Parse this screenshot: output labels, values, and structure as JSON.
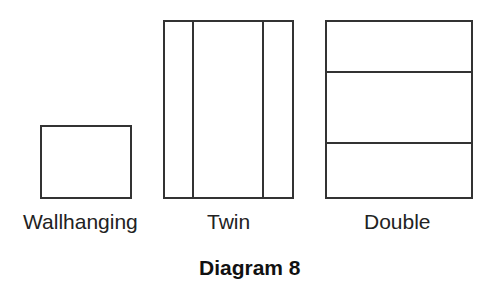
{
  "diagram": {
    "caption": "Diagram 8",
    "line_color": "#333333",
    "panels": [
      {
        "label": "Wallhanging",
        "divisions": "none"
      },
      {
        "label": "Twin",
        "divisions": "two vertical lines (three columns: narrow side, wide center, narrow side)"
      },
      {
        "label": "Double",
        "divisions": "two horizontal lines (three rows)"
      }
    ]
  }
}
